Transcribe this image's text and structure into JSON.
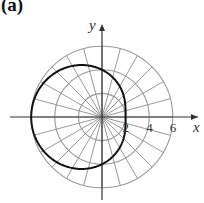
{
  "panel_label": "(a)",
  "chart_data": {
    "type": "line",
    "subtype": "polar",
    "title": "",
    "panel": "(a)",
    "equation": "r = 4 - 2cos(theta)",
    "xlabel": "x",
    "ylabel": "y",
    "x_tick_labels": [
      "2",
      "4",
      "6"
    ],
    "x_ticks": [
      2,
      4,
      6
    ],
    "polar_grid": {
      "radii": [
        2,
        4,
        6
      ],
      "ray_step_degrees": 15
    },
    "series": [
      {
        "name": "r = 4 - 2cos(theta)",
        "points_polar": [
          {
            "theta_deg": 0,
            "r": 2
          },
          {
            "theta_deg": 90,
            "r": 4
          },
          {
            "theta_deg": 180,
            "r": 6
          },
          {
            "theta_deg": 270,
            "r": 4
          }
        ]
      }
    ],
    "xlim": [
      -7,
      8
    ],
    "ylim": [
      -7,
      7
    ],
    "grid": true
  },
  "colors": {
    "grid": "#999999",
    "axis": "#333333",
    "curve": "#111111"
  }
}
